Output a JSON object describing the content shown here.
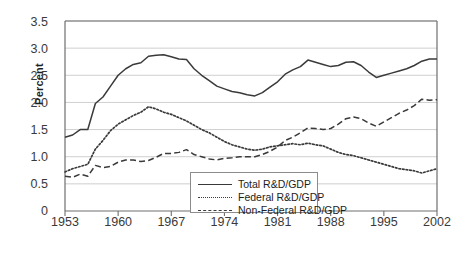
{
  "chart_data": {
    "type": "line",
    "title": "",
    "xlabel": "",
    "ylabel": "Percent",
    "xlim": [
      1953,
      2002
    ],
    "ylim": [
      0,
      3.5
    ],
    "ytick_labels": [
      "0",
      "0.5",
      "1.0",
      "1.5",
      "2.0",
      "2.5",
      "3.0",
      "3.5"
    ],
    "ytick_values": [
      0,
      0.5,
      1.0,
      1.5,
      2.0,
      2.5,
      3.0,
      3.5
    ],
    "xtick_labels": [
      "1953",
      "1960",
      "1967",
      "1974",
      "1981",
      "1988",
      "1995",
      "2002"
    ],
    "xtick_values": [
      1953,
      1960,
      1967,
      1974,
      1981,
      1988,
      1995,
      2002
    ],
    "grid": "horizontal",
    "legend_position": "bottom-center",
    "x": [
      1953,
      1954,
      1955,
      1956,
      1957,
      1958,
      1959,
      1960,
      1961,
      1962,
      1963,
      1964,
      1965,
      1966,
      1967,
      1968,
      1969,
      1970,
      1971,
      1972,
      1973,
      1974,
      1975,
      1976,
      1977,
      1978,
      1979,
      1980,
      1981,
      1982,
      1983,
      1984,
      1985,
      1986,
      1987,
      1988,
      1989,
      1990,
      1991,
      1992,
      1993,
      1994,
      1995,
      1996,
      1997,
      1998,
      1999,
      2000,
      2001,
      2002
    ],
    "series": [
      {
        "name": "Total R&D/GDP",
        "style": "solid",
        "color": "#3a3a3a",
        "values": [
          1.36,
          1.4,
          1.5,
          1.5,
          1.98,
          2.1,
          2.3,
          2.5,
          2.62,
          2.7,
          2.73,
          2.85,
          2.87,
          2.88,
          2.84,
          2.8,
          2.79,
          2.62,
          2.5,
          2.4,
          2.3,
          2.25,
          2.2,
          2.18,
          2.14,
          2.12,
          2.18,
          2.28,
          2.38,
          2.52,
          2.6,
          2.66,
          2.78,
          2.74,
          2.7,
          2.66,
          2.68,
          2.74,
          2.75,
          2.68,
          2.56,
          2.46,
          2.5,
          2.54,
          2.58,
          2.62,
          2.68,
          2.76,
          2.8,
          2.8
        ]
      },
      {
        "name": "Federal R&D/GDP",
        "style": "dotted",
        "color": "#3a3a3a",
        "values": [
          0.72,
          0.78,
          0.82,
          0.86,
          1.14,
          1.3,
          1.48,
          1.6,
          1.68,
          1.76,
          1.82,
          1.92,
          1.88,
          1.82,
          1.78,
          1.72,
          1.66,
          1.58,
          1.5,
          1.44,
          1.36,
          1.28,
          1.22,
          1.18,
          1.14,
          1.12,
          1.14,
          1.18,
          1.2,
          1.22,
          1.24,
          1.22,
          1.25,
          1.22,
          1.2,
          1.14,
          1.08,
          1.04,
          1.02,
          0.98,
          0.94,
          0.9,
          0.86,
          0.82,
          0.78,
          0.76,
          0.74,
          0.7,
          0.74,
          0.78
        ]
      },
      {
        "name": "Non-Federal R&D/GDP",
        "style": "dashed",
        "color": "#3a3a3a",
        "values": [
          0.64,
          0.62,
          0.68,
          0.64,
          0.84,
          0.8,
          0.82,
          0.9,
          0.94,
          0.94,
          0.91,
          0.93,
          0.99,
          1.06,
          1.06,
          1.08,
          1.13,
          1.04,
          1.0,
          0.96,
          0.94,
          0.97,
          0.98,
          1.0,
          1.0,
          1.0,
          1.04,
          1.1,
          1.18,
          1.3,
          1.36,
          1.44,
          1.53,
          1.52,
          1.5,
          1.52,
          1.6,
          1.7,
          1.73,
          1.7,
          1.62,
          1.56,
          1.64,
          1.72,
          1.8,
          1.86,
          1.94,
          2.06,
          2.04,
          2.05
        ]
      }
    ]
  },
  "legend": {
    "entries": [
      {
        "label": "Total R&D/GDP",
        "style": "solid"
      },
      {
        "label": "Federal R&D/GDP",
        "style": "dotted"
      },
      {
        "label": "Non-Federal R&D/GDP",
        "style": "dashed"
      }
    ]
  },
  "caption": {
    "text": ""
  }
}
